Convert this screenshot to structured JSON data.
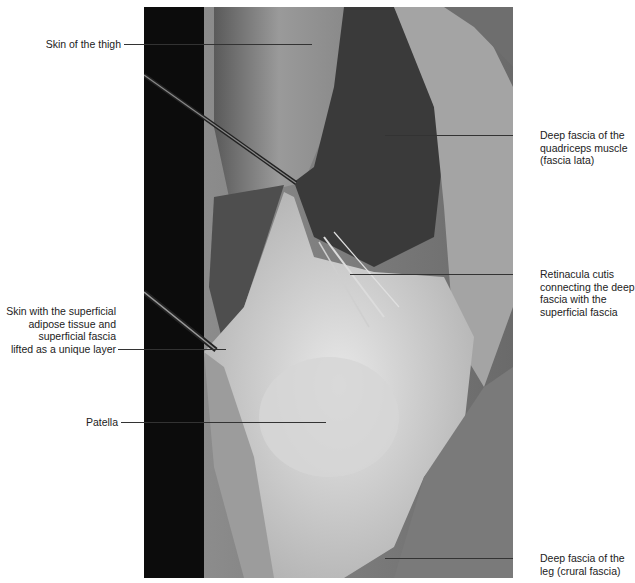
{
  "figure": {
    "type": "anatomical-dissection-photo",
    "labels": {
      "skin_thigh": "Skin of the thigh",
      "deep_fascia_quadriceps": [
        "Deep fascia of the",
        "quadriceps muscle",
        "(fascia lata)"
      ],
      "retinacula_cutis": [
        "Retinacula cutis",
        "connecting the deep",
        "fascia with the",
        "superficial fascia"
      ],
      "skin_layer": [
        "Skin with the superficial",
        "adipose tissue and",
        "superficial fascia",
        "lifted as a unique layer"
      ],
      "patella": "Patella",
      "deep_fascia_leg": [
        "Deep fascia of the",
        "leg (crural fascia)"
      ]
    }
  }
}
